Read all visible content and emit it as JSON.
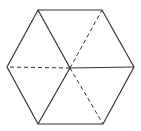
{
  "diagram": {
    "type": "hexagon-with-diagonals",
    "background": "#ffffff",
    "stroke_color": "#333333",
    "vertices": {
      "top_left": [
        38,
        10
      ],
      "top_right": [
        102,
        10
      ],
      "right": [
        134,
        67
      ],
      "bottom_right": [
        103,
        124
      ],
      "bottom_left": [
        38,
        124
      ],
      "left": [
        7,
        67
      ],
      "center": [
        70,
        68
      ]
    },
    "segments": [
      {
        "from": "center",
        "to": "top_left",
        "style": "solid"
      },
      {
        "from": "center",
        "to": "bottom_left",
        "style": "solid"
      },
      {
        "from": "center",
        "to": "right",
        "style": "solid"
      },
      {
        "from": "center",
        "to": "top_right",
        "style": "dashed"
      },
      {
        "from": "center",
        "to": "left",
        "style": "dashed"
      },
      {
        "from": "center",
        "to": "bottom_right",
        "style": "dashed"
      }
    ]
  }
}
